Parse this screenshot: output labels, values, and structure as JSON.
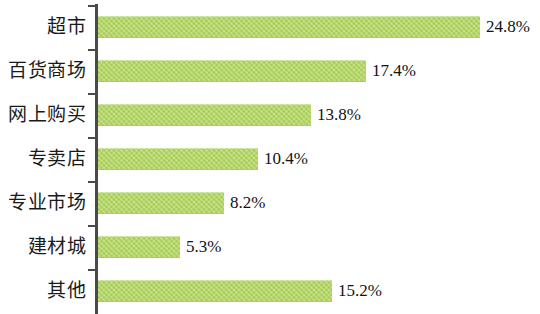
{
  "chart_data": {
    "type": "bar",
    "orientation": "horizontal",
    "title": "",
    "subtitle": "",
    "xlabel": "",
    "ylabel": "",
    "xlim": [
      0,
      28
    ],
    "grid": false,
    "legend": null,
    "unit": "%",
    "categories": [
      "超市",
      "百货商场",
      "网上购买",
      "专卖店",
      "专业市场",
      "建材城",
      "其他"
    ],
    "values": [
      24.8,
      17.4,
      13.8,
      10.4,
      8.2,
      5.3,
      15.2
    ],
    "value_labels": [
      "24.8%",
      "17.4%",
      "13.8%",
      "10.4%",
      "8.2%",
      "5.3%",
      "15.2%"
    ],
    "series": [
      {
        "name": "",
        "values": [
          24.8,
          17.4,
          13.8,
          10.4,
          8.2,
          5.3,
          15.2
        ]
      }
    ],
    "colors": {
      "bar": "#a4cc4b",
      "axis": "#4a4a48",
      "text": "#131313",
      "background": "#ffffff"
    }
  },
  "rows": [
    {
      "label": "超市",
      "value_label": "24.8%"
    },
    {
      "label": "百货商场",
      "value_label": "17.4%"
    },
    {
      "label": "网上购买",
      "value_label": "13.8%"
    },
    {
      "label": "专卖店",
      "value_label": "10.4%"
    },
    {
      "label": "专业市场",
      "value_label": "8.2%"
    },
    {
      "label": "建材城",
      "value_label": "5.3%"
    },
    {
      "label": "其他",
      "value_label": "15.2%"
    }
  ]
}
